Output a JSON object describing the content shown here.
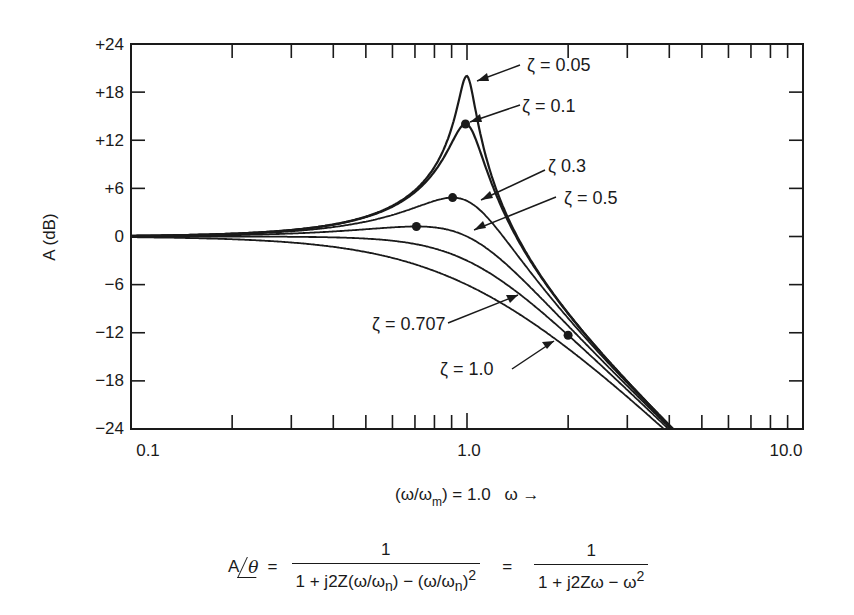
{
  "chart_data": {
    "type": "line",
    "title": "",
    "xlabel": "(ω/ω_m) = 1.0   ω →",
    "ylabel": "A (dB)",
    "xscale": "log",
    "xlim": [
      0.1,
      10.0
    ],
    "ylim": [
      -24,
      24
    ],
    "x_tick_labels": [
      "0.1",
      "1.0",
      "10.0"
    ],
    "y_ticks": [
      24,
      18,
      12,
      6,
      0,
      -6,
      -12,
      -18,
      -24
    ],
    "y_tick_labels": [
      "+24",
      "+18",
      "+12",
      "+6",
      "0",
      "−6",
      "−12",
      "−18",
      "−24"
    ],
    "grid": false,
    "formula_model": "A(dB) = -10*log10((1-ω²)² + (2ζω)²)",
    "series": [
      {
        "name": "ζ = 0.05",
        "zeta": 0.05,
        "label": "ζ = 0.05",
        "peak_db": 20.0,
        "points": [
          [
            0.1,
            0.09
          ],
          [
            0.5,
            2.5
          ],
          [
            0.8,
            8.5
          ],
          [
            1.0,
            20.0
          ],
          [
            1.5,
            -8.0
          ],
          [
            2.0,
            -9.5
          ],
          [
            4.0,
            -23.5
          ]
        ]
      },
      {
        "name": "ζ = 0.1",
        "zeta": 0.1,
        "label": "ζ = 0.1",
        "peak_db": 14.0,
        "marker_at": [
          0.99,
          14.0
        ],
        "points": [
          [
            0.1,
            0.09
          ],
          [
            0.5,
            2.4
          ],
          [
            0.8,
            8.0
          ],
          [
            1.0,
            14.0
          ],
          [
            1.5,
            -8.1
          ],
          [
            2.0,
            -9.6
          ],
          [
            4.0,
            -23.5
          ]
        ]
      },
      {
        "name": "ζ = 0.3",
        "zeta": 0.3,
        "label": "ζ 0.3",
        "peak_db": 4.8,
        "marker_at": [
          0.906,
          4.8
        ],
        "points": [
          [
            0.1,
            0.07
          ],
          [
            0.5,
            1.8
          ],
          [
            0.8,
            4.3
          ],
          [
            1.0,
            4.4
          ],
          [
            1.5,
            -6.4
          ],
          [
            2.0,
            -10.2
          ],
          [
            4.0,
            -23.6
          ]
        ]
      },
      {
        "name": "ζ = 0.5",
        "zeta": 0.5,
        "label": "ζ = 0.5",
        "peak_db": 1.25,
        "marker_at": [
          0.707,
          1.25
        ],
        "points": [
          [
            0.1,
            0.04
          ],
          [
            0.5,
            1.0
          ],
          [
            0.8,
            1.1
          ],
          [
            1.0,
            0.0
          ],
          [
            1.5,
            -6.7
          ],
          [
            2.0,
            -11.1
          ],
          [
            4.0,
            -24.0
          ]
        ]
      },
      {
        "name": "ζ = 0.707",
        "zeta": 0.707,
        "label": "ζ = 0.707",
        "marker_at": [
          2.0,
          -12.3
        ],
        "points": [
          [
            0.1,
            0.0
          ],
          [
            0.5,
            -0.3
          ],
          [
            0.8,
            -1.3
          ],
          [
            1.0,
            -3.0
          ],
          [
            1.5,
            -7.6
          ],
          [
            2.0,
            -12.3
          ],
          [
            4.0,
            -24.1
          ]
        ]
      },
      {
        "name": "ζ = 1.0",
        "zeta": 1.0,
        "label": "ζ = 1.0",
        "points": [
          [
            0.1,
            -0.09
          ],
          [
            0.5,
            -1.9
          ],
          [
            0.8,
            -4.2
          ],
          [
            1.0,
            -6.0
          ],
          [
            1.5,
            -10.2
          ],
          [
            2.0,
            -14.0
          ],
          [
            4.0,
            -24.6
          ]
        ]
      }
    ],
    "annotations": [
      {
        "text": "ζ = 0.05",
        "arrow_to_series": "ζ = 0.05"
      },
      {
        "text": "ζ = 0.1",
        "arrow_to_series": "ζ = 0.1"
      },
      {
        "text": "ζ 0.3",
        "arrow_to_series": "ζ = 0.3"
      },
      {
        "text": "ζ = 0.5",
        "arrow_to_series": "ζ = 0.5"
      },
      {
        "text": "ζ = 0.707",
        "arrow_to_series": "ζ = 0.707"
      },
      {
        "text": "ζ = 1.0",
        "arrow_to_series": "ζ = 1.0"
      }
    ]
  },
  "axes": {
    "ylabel": "A (dB)",
    "xlabel_main": "(ω/ω",
    "xlabel_sub": "m",
    "xlabel_rest": ") = 1.0",
    "xlabel_arrow": "ω →",
    "x_tick_labels": [
      "0.1",
      "1.0",
      "10.0"
    ],
    "y_tick_labels": [
      "+24",
      "+18",
      "+12",
      "+6",
      "0",
      "−6",
      "−12",
      "−18",
      "−24"
    ]
  },
  "labels": {
    "z005": "ζ = 0.05",
    "z01": "ζ = 0.1",
    "z03": "ζ 0.3",
    "z05": "ζ = 0.5",
    "z0707": "ζ = 0.707",
    "z10": "ζ = 1.0"
  },
  "formula": {
    "lhs_a": "A",
    "lhs_theta": "θ",
    "equals": "=",
    "num1": "1",
    "den1": "1 + j2Z(ω/ω",
    "den1_sub1": "n",
    "den1_mid": ") − (ω/ω",
    "den1_sub2": "n",
    "den1_end": ")",
    "den1_sup": "2",
    "equals2": "=",
    "num2": "1",
    "den2": "1 + j2Zω − ω",
    "den2_sup": "2"
  }
}
